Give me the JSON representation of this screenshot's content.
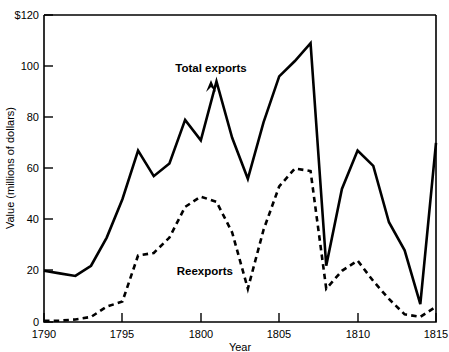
{
  "chart_data": {
    "type": "line",
    "title": "",
    "xlabel": "Year",
    "ylabel": "Value (millions of dollars)",
    "xlim": [
      1790,
      1815
    ],
    "ylim": [
      0,
      120
    ],
    "grid": false,
    "legend_position": "inline-annotation",
    "x_ticks": [
      "1790",
      "1795",
      "1800",
      "1805",
      "1810",
      "1815"
    ],
    "x_tick_values": [
      1790,
      1795,
      1800,
      1805,
      1810,
      1815
    ],
    "y_ticks": [
      "0",
      "20",
      "40",
      "60",
      "80",
      "100",
      "$120"
    ],
    "y_tick_values": [
      0,
      20,
      40,
      60,
      80,
      100,
      120
    ],
    "x": [
      1790,
      1791,
      1792,
      1793,
      1794,
      1795,
      1796,
      1797,
      1798,
      1799,
      1800,
      1801,
      1802,
      1803,
      1804,
      1805,
      1806,
      1807,
      1808,
      1809,
      1810,
      1811,
      1812,
      1813,
      1814,
      1815
    ],
    "series": [
      {
        "name": "Total exports",
        "style": "solid",
        "values": [
          20,
          19,
          18,
          22,
          33,
          48,
          67,
          57,
          62,
          79,
          71,
          94,
          72,
          56,
          78,
          96,
          102,
          109,
          22,
          52,
          67,
          61,
          39,
          28,
          7,
          70
        ]
      },
      {
        "name": "Reexports",
        "style": "dashed",
        "values": [
          0.5,
          0.5,
          1,
          2,
          6,
          8,
          26,
          27,
          33,
          45,
          49,
          47,
          35,
          13,
          36,
          53,
          60,
          59,
          13,
          20,
          24,
          16,
          9,
          3,
          2,
          6
        ]
      }
    ],
    "annotations": [
      {
        "text": "Total exports",
        "x": 1801,
        "y": 100
      },
      {
        "text": "Reexports",
        "x": 1802,
        "y": 18
      }
    ]
  }
}
